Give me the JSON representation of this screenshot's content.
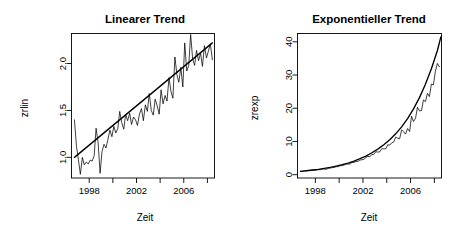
{
  "figure": {
    "background": "#ffffff",
    "foreground": "#000000",
    "panels": 2
  },
  "chart_data": [
    {
      "type": "line",
      "panel": "left",
      "title": "Linearer Trend",
      "xlabel": "Zeit",
      "ylabel": "zrlin",
      "xlim": [
        1996.5,
        2008.6
      ],
      "ylim": [
        0.78,
        2.32
      ],
      "grid": false,
      "legend": null,
      "xticks": [
        1998,
        2000,
        2002,
        2004,
        2006,
        2008
      ],
      "xticklabels": [
        "1998",
        "",
        "2002",
        "",
        "2006",
        ""
      ],
      "yticks": [
        1.0,
        1.5,
        2.0
      ],
      "yticklabels": [
        "1.0",
        "1.5",
        "2.0"
      ],
      "series": [
        {
          "name": "zrlin",
          "style": "observed",
          "x": [
            1996.75,
            1996.92,
            1997.08,
            1997.25,
            1997.42,
            1997.58,
            1997.75,
            1997.92,
            1998.08,
            1998.25,
            1998.42,
            1998.58,
            1998.75,
            1998.92,
            1999.08,
            1999.25,
            1999.42,
            1999.58,
            1999.75,
            1999.92,
            2000.08,
            2000.25,
            2000.42,
            2000.58,
            2000.75,
            2000.92,
            2001.08,
            2001.25,
            2001.42,
            2001.58,
            2001.75,
            2001.92,
            2002.08,
            2002.25,
            2002.42,
            2002.58,
            2002.75,
            2002.92,
            2003.08,
            2003.25,
            2003.42,
            2003.58,
            2003.75,
            2003.92,
            2004.08,
            2004.25,
            2004.42,
            2004.58,
            2004.75,
            2004.92,
            2005.08,
            2005.25,
            2005.42,
            2005.58,
            2005.75,
            2005.92,
            2006.08,
            2006.25,
            2006.42,
            2006.58,
            2006.75,
            2006.92,
            2007.08,
            2007.25,
            2007.42,
            2007.58,
            2007.75,
            2007.92,
            2008.08,
            2008.25,
            2008.42
          ],
          "y": [
            1.4,
            1.12,
            0.98,
            0.82,
            1.0,
            0.92,
            0.95,
            0.93,
            0.97,
            0.96,
            1.02,
            1.31,
            1.16,
            0.83,
            1.06,
            1.14,
            1.1,
            1.19,
            1.29,
            1.22,
            1.33,
            1.26,
            1.31,
            1.49,
            1.37,
            1.3,
            1.46,
            1.39,
            1.47,
            1.35,
            1.43,
            1.4,
            1.34,
            1.46,
            1.52,
            1.39,
            1.56,
            1.49,
            1.68,
            1.5,
            1.45,
            1.62,
            1.55,
            1.46,
            1.72,
            1.57,
            1.66,
            1.6,
            1.85,
            1.7,
            1.63,
            2.07,
            1.88,
            1.8,
            1.96,
            1.75,
            2.22,
            1.92,
            1.98,
            2.31,
            2.05,
            1.98,
            2.14,
            2.03,
            2.11,
            1.97,
            2.19,
            2.06,
            2.13,
            2.21,
            2.04
          ]
        },
        {
          "name": "Linearer Trend",
          "style": "fit",
          "x": [
            1996.75,
            2008.42
          ],
          "y": [
            1.0,
            2.22
          ]
        }
      ]
    },
    {
      "type": "line",
      "panel": "right",
      "title": "Exponentieller Trend",
      "xlabel": "Zeit",
      "ylabel": "zrexp",
      "xlim": [
        1996.5,
        2008.6
      ],
      "ylim": [
        -1.0,
        42.5
      ],
      "grid": false,
      "legend": null,
      "xticks": [
        1998,
        2000,
        2002,
        2004,
        2006,
        2008
      ],
      "xticklabels": [
        "1998",
        "",
        "2002",
        "",
        "2006",
        ""
      ],
      "yticks": [
        0,
        10,
        20,
        30,
        40
      ],
      "yticklabels": [
        "0",
        "10",
        "20",
        "30",
        "40"
      ],
      "series": [
        {
          "name": "zrexp",
          "style": "observed",
          "x": [
            1996.75,
            1996.92,
            1997.08,
            1997.25,
            1997.42,
            1997.58,
            1997.75,
            1997.92,
            1998.08,
            1998.25,
            1998.42,
            1998.58,
            1998.75,
            1998.92,
            1999.08,
            1999.25,
            1999.42,
            1999.58,
            1999.75,
            1999.92,
            2000.08,
            2000.25,
            2000.42,
            2000.58,
            2000.75,
            2000.92,
            2001.08,
            2001.25,
            2001.42,
            2001.58,
            2001.75,
            2001.92,
            2002.08,
            2002.25,
            2002.42,
            2002.58,
            2002.75,
            2002.92,
            2003.08,
            2003.25,
            2003.42,
            2003.58,
            2003.75,
            2003.92,
            2004.08,
            2004.25,
            2004.42,
            2004.58,
            2004.75,
            2004.92,
            2005.08,
            2005.25,
            2005.42,
            2005.58,
            2005.75,
            2005.92,
            2006.08,
            2006.25,
            2006.42,
            2006.58,
            2006.75,
            2006.92,
            2007.08,
            2007.25,
            2007.42,
            2007.58,
            2007.75,
            2007.92,
            2008.08,
            2008.25,
            2008.42
          ],
          "y": [
            1.0,
            1.0,
            1.1,
            1.1,
            1.2,
            1.2,
            1.3,
            1.3,
            1.4,
            1.5,
            1.5,
            1.7,
            1.7,
            1.6,
            1.9,
            2.0,
            2.1,
            2.2,
            2.4,
            2.4,
            2.7,
            2.7,
            2.9,
            3.2,
            3.2,
            3.2,
            3.7,
            3.7,
            4.0,
            4.0,
            4.4,
            4.5,
            4.6,
            5.2,
            5.5,
            5.4,
            6.1,
            6.1,
            6.9,
            6.8,
            6.9,
            7.8,
            7.8,
            7.8,
            9.0,
            8.9,
            9.6,
            9.8,
            11.3,
            11.0,
            10.8,
            13.5,
            12.9,
            12.2,
            13.9,
            13.0,
            17.6,
            16.0,
            17.0,
            20.3,
            19.2,
            19.3,
            22.5,
            22.0,
            24.5,
            23.5,
            27.3,
            27.0,
            31.0,
            33.5,
            32.5,
            40.2,
            36.8,
            39.2
          ]
        },
        {
          "name": "Exponentieller Trend",
          "style": "fit",
          "x": [
            1996.75,
            1997.25,
            1997.75,
            1998.25,
            1998.75,
            1999.25,
            1999.75,
            2000.25,
            2000.75,
            2001.25,
            2001.75,
            2002.25,
            2002.75,
            2003.25,
            2003.75,
            2004.25,
            2004.75,
            2005.25,
            2005.75,
            2006.25,
            2006.75,
            2007.25,
            2007.75,
            2008.25,
            2008.55
          ],
          "y": [
            1.0,
            1.2,
            1.4,
            1.6,
            1.9,
            2.2,
            2.6,
            3.0,
            3.5,
            4.1,
            4.8,
            5.6,
            6.6,
            7.7,
            9.0,
            10.5,
            12.3,
            14.4,
            16.9,
            19.8,
            23.2,
            27.2,
            31.9,
            37.3,
            41.5
          ]
        }
      ]
    }
  ]
}
